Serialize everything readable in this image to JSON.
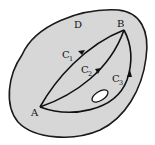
{
  "diagram": {
    "region_label": "D",
    "start_point": "A",
    "end_point": "B",
    "curves": [
      {
        "name": "C",
        "sub": "1"
      },
      {
        "name": "C",
        "sub": "2"
      },
      {
        "name": "C",
        "sub": "3"
      }
    ],
    "colors": {
      "region_fill": "#d9d9d9",
      "stroke": "#111111",
      "hole_fill": "#ffffff"
    }
  }
}
